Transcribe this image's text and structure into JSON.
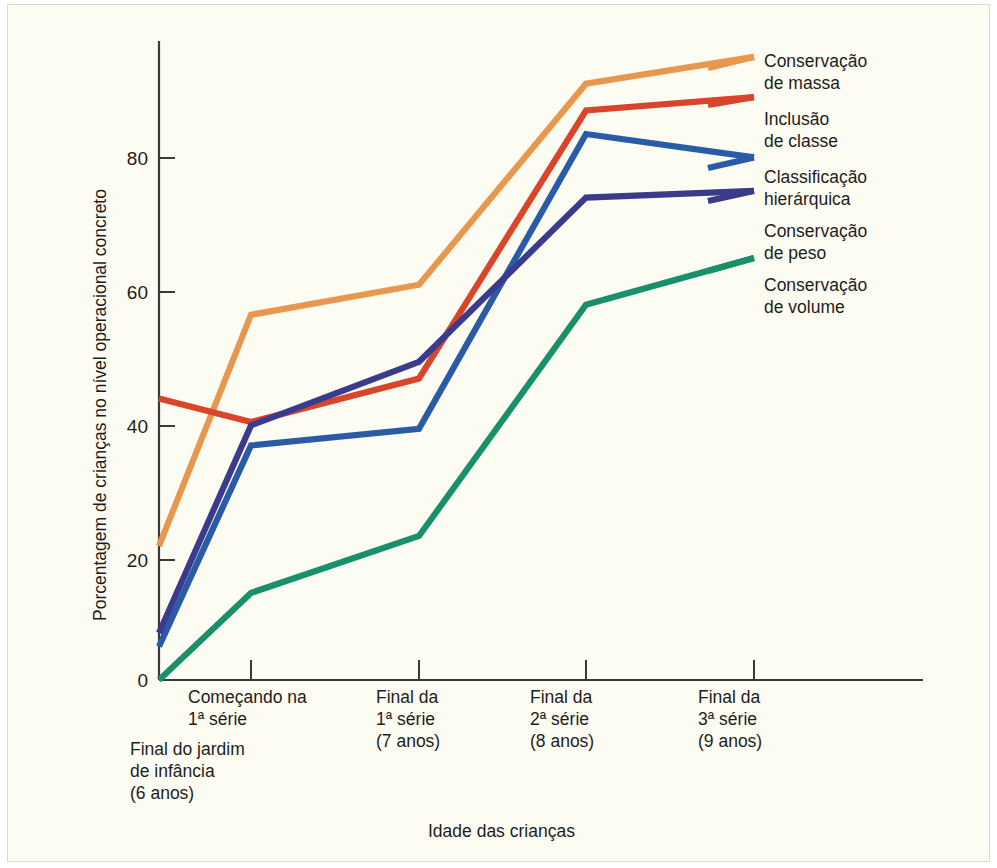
{
  "chart_data": {
    "type": "line",
    "title": "",
    "xlabel": "Idade das crianças",
    "ylabel": "Porcentagem de crianças no nível operacional concreto",
    "categories": [
      "Final do jardim de infância (6 anos)",
      "Começando na 1ª série",
      "Final da 1ª série (7 anos)",
      "Final da 2ª série (8 anos)",
      "Final da 3ª série (9 anos)"
    ],
    "category_labels": [
      {
        "lines": [
          "Final do jardim",
          "de infância",
          "(6 anos)"
        ]
      },
      {
        "lines": [
          "Começando na",
          "1ª série"
        ]
      },
      {
        "lines": [
          "Final da",
          "1ª série",
          "(7 anos)"
        ]
      },
      {
        "lines": [
          "Final da",
          "2ª série",
          "(8 anos)"
        ]
      },
      {
        "lines": [
          "Final da",
          "3ª série",
          "(9 anos)"
        ]
      }
    ],
    "ylim": [
      0,
      100
    ],
    "yticks": [
      0,
      20,
      40,
      60,
      80
    ],
    "ytick_labels": [
      "0",
      "20",
      "40",
      "60",
      "80"
    ],
    "grid": false,
    "legend_position": "right",
    "series": [
      {
        "name": "Conservação de massa",
        "legend_lines": [
          "Conservação",
          "de massa"
        ],
        "color": "#e8974f",
        "values": [
          20,
          54.5,
          59,
          89,
          93
        ]
      },
      {
        "name": "Inclusão de classe",
        "legend_lines": [
          "Inclusão",
          "de classe"
        ],
        "color": "#d8452a",
        "values": [
          42,
          38.5,
          45,
          85,
          87
        ]
      },
      {
        "name": "Classificação hierárquica",
        "legend_lines": [
          "Classificação",
          "hierárquica"
        ],
        "color": "#2a5ba6",
        "values": [
          5,
          35,
          37.5,
          81.5,
          78
        ]
      },
      {
        "name": "Conservação de peso",
        "legend_lines": [
          "Conservação",
          "de peso"
        ],
        "color": "#3a3b8d",
        "values": [
          7,
          38,
          47.5,
          72,
          73
        ]
      },
      {
        "name": "Conservação de volume",
        "legend_lines": [
          "Conservação",
          "de volume"
        ],
        "color": "#189069",
        "values": [
          0,
          13,
          21.5,
          56,
          63
        ]
      }
    ]
  },
  "axes": {
    "y_title": "Porcentagem de crianças no nível operacional concreto",
    "x_title": "Idade das crianças"
  }
}
